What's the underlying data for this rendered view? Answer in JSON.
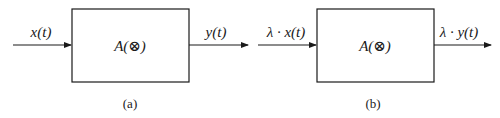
{
  "diagram": {
    "panels": [
      {
        "caption": "(a)",
        "input_label": "x(t)",
        "block_label": "A(⊗)",
        "output_label": "y(t)"
      },
      {
        "caption": "(b)",
        "input_label": "λ · x(t)",
        "block_label": "A(⊗)",
        "output_label": "λ · y(t)"
      }
    ],
    "colors": {
      "stroke": "#1a1a1a",
      "background": "#ffffff"
    }
  }
}
